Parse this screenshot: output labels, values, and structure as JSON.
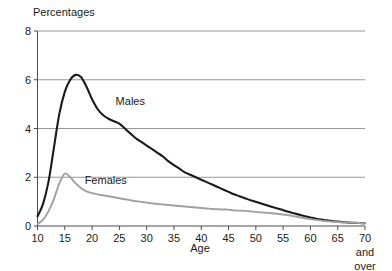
{
  "chart_data": {
    "type": "line",
    "title": "",
    "ylabel": "Percentages",
    "xlabel": "Age",
    "xlim": [
      10,
      70
    ],
    "ylim": [
      0,
      8
    ],
    "grid": true,
    "grid_axis": "y",
    "legend": "inline-annotations",
    "y_ticks": [
      0,
      2,
      4,
      6,
      8
    ],
    "y_tick_labels": [
      "0",
      "2",
      "4",
      "6",
      "8"
    ],
    "x_ticks": [
      10,
      15,
      20,
      25,
      30,
      35,
      40,
      45,
      50,
      55,
      60,
      65,
      70
    ],
    "x_tick_labels": [
      "10",
      "15",
      "20",
      "25",
      "30",
      "35",
      "40",
      "45",
      "50",
      "55",
      "60",
      "65",
      "70"
    ],
    "x_last_tick_extra_lines": [
      "and",
      "over"
    ],
    "x": [
      10,
      11,
      12,
      13,
      14,
      15,
      16,
      17,
      18,
      19,
      20,
      21,
      22,
      23,
      24,
      25,
      26,
      27,
      28,
      29,
      30,
      31,
      32,
      33,
      34,
      35,
      36,
      37,
      38,
      39,
      40,
      41,
      42,
      43,
      44,
      45,
      46,
      47,
      48,
      49,
      50,
      51,
      52,
      53,
      54,
      55,
      56,
      57,
      58,
      59,
      60,
      61,
      62,
      63,
      64,
      65,
      66,
      67,
      68,
      69,
      70
    ],
    "series": [
      {
        "name": "Males",
        "color": "#1a1a1a",
        "label_x": 27,
        "label_y": 4.95,
        "values": [
          0.4,
          0.9,
          1.8,
          3.2,
          4.6,
          5.5,
          6.0,
          6.2,
          6.1,
          5.7,
          5.2,
          4.8,
          4.55,
          4.4,
          4.3,
          4.2,
          4.0,
          3.8,
          3.6,
          3.45,
          3.3,
          3.15,
          3.0,
          2.85,
          2.65,
          2.5,
          2.35,
          2.2,
          2.1,
          2.0,
          1.9,
          1.8,
          1.7,
          1.6,
          1.5,
          1.4,
          1.3,
          1.22,
          1.14,
          1.06,
          1.0,
          0.92,
          0.85,
          0.78,
          0.72,
          0.65,
          0.58,
          0.52,
          0.46,
          0.4,
          0.35,
          0.3,
          0.26,
          0.23,
          0.2,
          0.18,
          0.16,
          0.14,
          0.13,
          0.12,
          0.11
        ]
      },
      {
        "name": "Females",
        "color": "#a0a0a0",
        "label_x": 22.5,
        "label_y": 1.72,
        "values": [
          0.08,
          0.25,
          0.6,
          1.1,
          1.75,
          2.15,
          2.0,
          1.75,
          1.55,
          1.42,
          1.35,
          1.3,
          1.26,
          1.22,
          1.18,
          1.14,
          1.1,
          1.06,
          1.02,
          0.99,
          0.96,
          0.93,
          0.9,
          0.88,
          0.86,
          0.84,
          0.82,
          0.8,
          0.78,
          0.76,
          0.74,
          0.72,
          0.7,
          0.69,
          0.68,
          0.67,
          0.64,
          0.63,
          0.62,
          0.6,
          0.58,
          0.56,
          0.54,
          0.52,
          0.5,
          0.47,
          0.44,
          0.4,
          0.36,
          0.32,
          0.28,
          0.25,
          0.22,
          0.2,
          0.18,
          0.16,
          0.15,
          0.14,
          0.13,
          0.12,
          0.11
        ]
      }
    ],
    "colors": {
      "males": "#1a1a1a",
      "females": "#a0a0a0",
      "grid": "#8c8c8c",
      "axis": "#4d4d4d",
      "text": "#1a1a1a",
      "background": "#ffffff"
    }
  }
}
